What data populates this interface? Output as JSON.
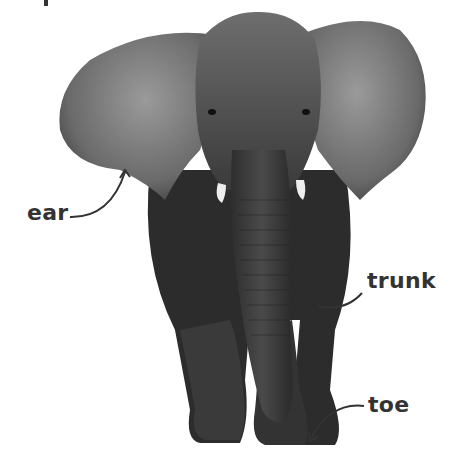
{
  "labels": {
    "ear": "ear",
    "trunk": "trunk",
    "toe": "toe"
  },
  "colors": {
    "label_text": "#333333",
    "pointer_line": "#333333",
    "body_dark": "#2a2a2a",
    "body_mid": "#555555",
    "ear_light": "#8a8a8a"
  }
}
